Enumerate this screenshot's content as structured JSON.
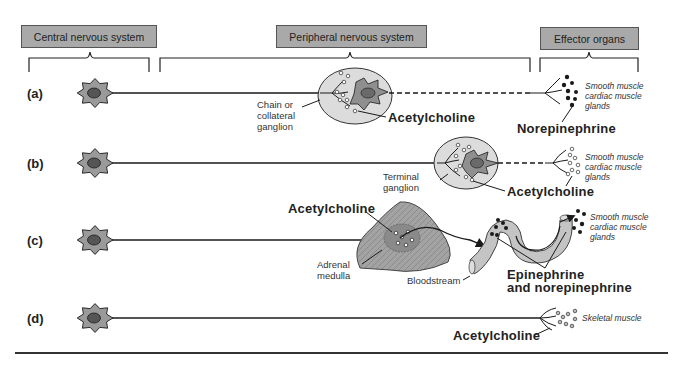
{
  "headers": {
    "cns": "Central nervous system",
    "pns": "Peripheral nervous system",
    "effector": "Effector organs"
  },
  "rows": [
    {
      "id": "a",
      "label": "(a)",
      "ganglion_label": [
        "Chain or",
        "collateral",
        "ganglion"
      ],
      "transmitter_pre": "Acetylcholine",
      "transmitter_post": "Norepinephrine",
      "effector": [
        "Smooth muscle",
        "cardiac muscle",
        "glands"
      ]
    },
    {
      "id": "b",
      "label": "(b)",
      "ganglion_label": [
        "Terminal",
        "ganglion"
      ],
      "transmitter_pre": "Acetylcholine",
      "effector": [
        "Smooth muscle",
        "cardiac muscle",
        "glands"
      ]
    },
    {
      "id": "c",
      "label": "(c)",
      "transmitter_pre": "Acetylcholine",
      "organ_label": [
        "Adrenal",
        "medulla"
      ],
      "vessel_label": "Bloodstream",
      "hormones": [
        "Epinephrine",
        "and norepinephrine"
      ],
      "effector": [
        "Smooth muscle",
        "cardiac muscle",
        "glands"
      ]
    },
    {
      "id": "d",
      "label": "(d)",
      "transmitter": "Acetylcholine",
      "effector": [
        "Skeletal muscle"
      ]
    }
  ],
  "colors": {
    "header_fill": "#a9a9a9",
    "cell_fill": "#9a9a9a",
    "ganglion_fill": "#dcdcdc",
    "adrenal_fill": "#a3a3a3",
    "vessel_fill": "#c4c4c4",
    "line": "#1a1a1a"
  }
}
